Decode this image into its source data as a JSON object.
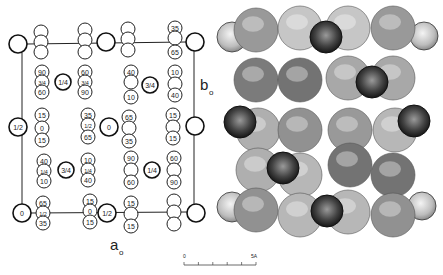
{
  "figure": {
    "left_panel": {
      "axis_labels": {
        "a": "a",
        "a_sub": "o",
        "b": "b",
        "b_sub": "o"
      },
      "cell_corners": [
        {
          "x": 18,
          "y": 44,
          "r": 9,
          "label": ""
        },
        {
          "x": 195,
          "y": 42,
          "r": 9,
          "label": ""
        },
        {
          "x": 18,
          "y": 127,
          "r": 9,
          "label": "1/2"
        },
        {
          "x": 195,
          "y": 126,
          "r": 9,
          "label": ""
        },
        {
          "x": 22,
          "y": 213,
          "r": 9,
          "label": "0"
        },
        {
          "x": 196,
          "y": 213,
          "r": 9,
          "label": ""
        }
      ],
      "center_cations": [
        {
          "x": 106,
          "y": 42,
          "r": 9,
          "label": ""
        },
        {
          "x": 63,
          "y": 82,
          "r": 8,
          "label": "1/4"
        },
        {
          "x": 150,
          "y": 85,
          "r": 8,
          "label": "3/4"
        },
        {
          "x": 109,
          "y": 127,
          "r": 9,
          "label": "0"
        },
        {
          "x": 66,
          "y": 170,
          "r": 8,
          "label": "3/4"
        },
        {
          "x": 152,
          "y": 170,
          "r": 8,
          "label": "1/4"
        },
        {
          "x": 107,
          "y": 213,
          "r": 9,
          "label": "1/2"
        }
      ],
      "anion_stacks": [
        {
          "x": 41,
          "y": [
            32,
            42,
            52
          ],
          "labels": [
            "",
            "",
            ""
          ]
        },
        {
          "x": 85,
          "y": [
            30,
            40,
            52
          ],
          "labels": [
            "",
            "",
            ""
          ]
        },
        {
          "x": 128,
          "y": [
            29,
            39,
            50
          ],
          "labels": [
            "",
            "",
            ""
          ]
        },
        {
          "x": 175,
          "y": [
            28,
            38,
            52
          ],
          "labels": [
            "35",
            "",
            "65"
          ]
        },
        {
          "x": 42,
          "y": [
            72,
            82,
            92
          ],
          "labels": [
            "90",
            "3/4",
            "60"
          ]
        },
        {
          "x": 85,
          "y": [
            72,
            82,
            92
          ],
          "labels": [
            "60",
            "3/4",
            "90"
          ]
        },
        {
          "x": 131,
          "y": [
            72,
            82,
            97
          ],
          "labels": [
            "40",
            "",
            "10"
          ]
        },
        {
          "x": 175,
          "y": [
            72,
            84,
            95
          ],
          "labels": [
            "10",
            "",
            "40"
          ]
        },
        {
          "x": 42,
          "y": [
            115,
            128,
            140
          ],
          "labels": [
            "15",
            "0",
            "15"
          ]
        },
        {
          "x": 88,
          "y": [
            115,
            125,
            137
          ],
          "labels": [
            "35",
            "1/2",
            "65"
          ]
        },
        {
          "x": 129,
          "y": [
            117,
            128,
            141
          ],
          "labels": [
            "65",
            "",
            "35"
          ]
        },
        {
          "x": 173,
          "y": [
            115,
            127,
            138
          ],
          "labels": [
            "15",
            "",
            "15"
          ]
        },
        {
          "x": 44,
          "y": [
            161,
            171,
            181
          ],
          "labels": [
            "40",
            "1/4",
            "10"
          ]
        },
        {
          "x": 88,
          "y": [
            160,
            170,
            180
          ],
          "labels": [
            "10",
            "1/4",
            "40"
          ]
        },
        {
          "x": 131,
          "y": [
            158,
            170,
            182
          ],
          "labels": [
            "90",
            "",
            "60"
          ]
        },
        {
          "x": 174,
          "y": [
            158,
            170,
            182
          ],
          "labels": [
            "60",
            "",
            "90"
          ]
        },
        {
          "x": 43,
          "y": [
            203,
            213,
            223
          ],
          "labels": [
            "65",
            "1/2",
            "35"
          ]
        },
        {
          "x": 90,
          "y": [
            201,
            211,
            222
          ],
          "labels": [
            "15",
            "0",
            "15"
          ]
        },
        {
          "x": 131,
          "y": [
            203,
            214,
            226
          ],
          "labels": [
            "15",
            "",
            "15"
          ]
        },
        {
          "x": 174,
          "y": [
            201,
            212,
            224
          ],
          "labels": [
            "",
            "",
            ""
          ]
        }
      ]
    },
    "right_panel": {
      "description": "space-filling model",
      "columns_x": [
        254,
        300,
        347,
        394
      ],
      "light_side_spheres": [
        {
          "x": 232,
          "y": 37,
          "r": 15
        },
        {
          "x": 424,
          "y": 36,
          "r": 14
        },
        {
          "x": 232,
          "y": 207,
          "r": 15
        },
        {
          "x": 422,
          "y": 206,
          "r": 14
        }
      ],
      "column_spheres": [
        {
          "x": 256,
          "y": 30,
          "r": 22,
          "tone": 0.55
        },
        {
          "x": 256,
          "y": 80,
          "r": 22,
          "tone": 0.75
        },
        {
          "x": 258,
          "y": 130,
          "r": 22,
          "tone": 0.4
        },
        {
          "x": 258,
          "y": 170,
          "r": 22,
          "tone": 0.4
        },
        {
          "x": 256,
          "y": 210,
          "r": 22,
          "tone": 0.6
        },
        {
          "x": 300,
          "y": 28,
          "r": 22,
          "tone": 0.25
        },
        {
          "x": 300,
          "y": 80,
          "r": 22,
          "tone": 0.8
        },
        {
          "x": 300,
          "y": 130,
          "r": 22,
          "tone": 0.6
        },
        {
          "x": 300,
          "y": 175,
          "r": 22,
          "tone": 0.35
        },
        {
          "x": 300,
          "y": 215,
          "r": 22,
          "tone": 0.35
        },
        {
          "x": 348,
          "y": 28,
          "r": 22,
          "tone": 0.25
        },
        {
          "x": 348,
          "y": 78,
          "r": 22,
          "tone": 0.45
        },
        {
          "x": 350,
          "y": 130,
          "r": 22,
          "tone": 0.55
        },
        {
          "x": 350,
          "y": 165,
          "r": 22,
          "tone": 0.8
        },
        {
          "x": 348,
          "y": 212,
          "r": 22,
          "tone": 0.35
        },
        {
          "x": 393,
          "y": 28,
          "r": 22,
          "tone": 0.55
        },
        {
          "x": 393,
          "y": 78,
          "r": 22,
          "tone": 0.45
        },
        {
          "x": 395,
          "y": 130,
          "r": 22,
          "tone": 0.35
        },
        {
          "x": 393,
          "y": 175,
          "r": 22,
          "tone": 0.8
        },
        {
          "x": 393,
          "y": 215,
          "r": 22,
          "tone": 0.6
        }
      ],
      "dark_cations": [
        {
          "x": 326,
          "y": 37,
          "r": 16
        },
        {
          "x": 372,
          "y": 82,
          "r": 16
        },
        {
          "x": 240,
          "y": 122,
          "r": 16
        },
        {
          "x": 414,
          "y": 121,
          "r": 16
        },
        {
          "x": 283,
          "y": 168,
          "r": 16
        },
        {
          "x": 327,
          "y": 211,
          "r": 16
        }
      ]
    },
    "scale_bar": {
      "start_label": "0",
      "end_label": "5A",
      "ticks": 5
    }
  }
}
